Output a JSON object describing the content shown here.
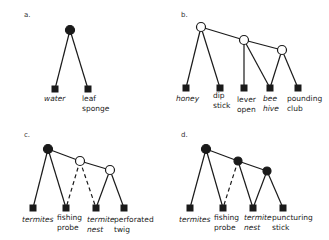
{
  "panels": [
    {
      "letter": "a.",
      "leaves": [
        {
          "line1": "water",
          "line2": "",
          "italic": true
        },
        {
          "line1": "leaf",
          "line2": "sponge",
          "italic": false
        }
      ]
    },
    {
      "letter": "b.",
      "leaves": [
        {
          "line1": "honey",
          "line2": "",
          "italic": true
        },
        {
          "line1": "dip",
          "line2": "stick",
          "italic": false
        },
        {
          "line1": "lever",
          "line2": "open",
          "italic": false
        },
        {
          "line1": "bee",
          "line2": "hive",
          "italic": true
        },
        {
          "line1": "pounding",
          "line2": "club",
          "italic": false
        }
      ]
    },
    {
      "letter": "c.",
      "leaves": [
        {
          "line1": "termites",
          "line2": "",
          "italic": true
        },
        {
          "line1": "fishing",
          "line2": "probe",
          "italic": false
        },
        {
          "line1": "termite",
          "line2": "nest",
          "italic": true
        },
        {
          "line1": "perforated",
          "line2": "twig",
          "italic": false
        }
      ]
    },
    {
      "letter": "d.",
      "leaves": [
        {
          "line1": "termites",
          "line2": "",
          "italic": true
        },
        {
          "line1": "fishing",
          "line2": "probe",
          "italic": false
        },
        {
          "line1": "termite",
          "line2": "nest",
          "italic": true
        },
        {
          "line1": "puncturing",
          "line2": "stick",
          "italic": false
        }
      ]
    }
  ],
  "legend_semantics": {
    "filled_circle": "filled-node",
    "open_circle": "open-node",
    "square": "leaf-node",
    "dashed_line": "dashed-edge"
  },
  "colors": {
    "ink": "#1a1a1a",
    "background": "#ffffff"
  }
}
